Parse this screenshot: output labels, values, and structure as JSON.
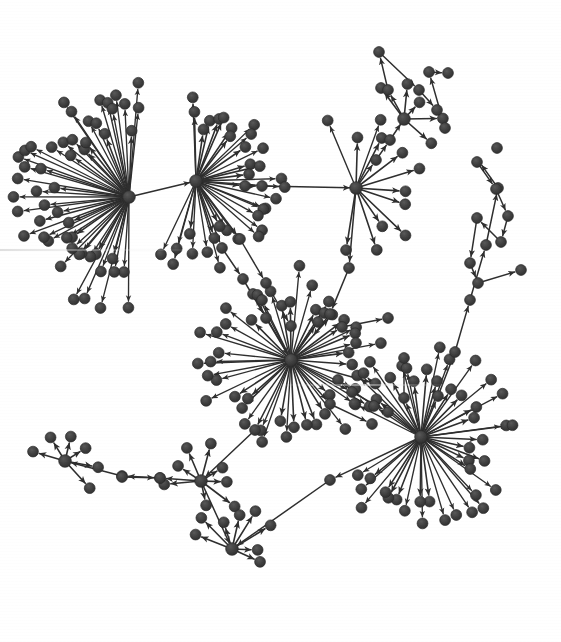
{
  "figure": {
    "kind": "directed-network-graph",
    "background_color": "#ffffff",
    "node_color": "#3c3c3c",
    "node_stroke_color": "#2a2a2a",
    "edge_color": "#2e2e2e",
    "arrow_color": "#2e2e2e",
    "width": 561,
    "height": 642
  },
  "chart_data": {
    "type": "scatter",
    "title": "",
    "subtitle": "",
    "xlabel": "",
    "ylabel": "",
    "grid": false,
    "legend": null,
    "xlim": [
      0,
      561
    ],
    "ylim": [
      0,
      642
    ],
    "node_radius": 5.4,
    "node_count": 292,
    "edge_count": 318,
    "hubs": [
      {
        "id": "H1",
        "label": "hub-upper-left",
        "x": 129,
        "y": 197,
        "degree": 62
      },
      {
        "id": "H2",
        "label": "hub-upper-mid",
        "x": 196,
        "y": 181,
        "degree": 40
      },
      {
        "id": "H3",
        "label": "hub-center",
        "x": 291,
        "y": 360,
        "degree": 58
      },
      {
        "id": "H4",
        "label": "hub-right",
        "x": 421,
        "y": 437,
        "degree": 54
      },
      {
        "id": "H5",
        "label": "hub-top-right",
        "x": 356,
        "y": 188,
        "degree": 14
      },
      {
        "id": "H6",
        "label": "hub-bottom-left",
        "x": 65,
        "y": 461,
        "degree": 7
      },
      {
        "id": "H7",
        "label": "hub-bottom-mid",
        "x": 201,
        "y": 481,
        "degree": 8
      },
      {
        "id": "H8",
        "label": "hub-bottom-center",
        "x": 232,
        "y": 549,
        "degree": 8
      },
      {
        "id": "H9",
        "label": "hub-upper-right-fan",
        "x": 404,
        "y": 119,
        "degree": 6
      }
    ],
    "clusters": [
      {
        "id": "C1",
        "hub": "H1",
        "center": [
          129,
          197
        ],
        "leaf_count": 52,
        "radius_range": [
          38,
          118
        ],
        "angle_range_deg": [
          92,
          278
        ],
        "note": "largest fan, opens to the left/down-left"
      },
      {
        "id": "C2",
        "hub": "H2",
        "center": [
          196,
          181
        ],
        "leaf_count": 34,
        "radius_range": [
          30,
          92
        ],
        "angle_range_deg": [
          -95,
          115
        ],
        "note": "fan opens up/right, overlaps C1"
      },
      {
        "id": "C3",
        "hub": "H3",
        "center": [
          291,
          360
        ],
        "leaf_count": 46,
        "radius_range": [
          30,
          95
        ],
        "angle_range_deg": [
          -180,
          180
        ],
        "note": "full radial burst, center of figure"
      },
      {
        "id": "C4",
        "hub": "H4",
        "center": [
          421,
          437
        ],
        "leaf_count": 44,
        "radius_range": [
          28,
          95
        ],
        "angle_range_deg": [
          -150,
          150
        ],
        "note": "fan opens right/down"
      },
      {
        "id": "C5",
        "hub": "H5",
        "center": [
          356,
          188
        ],
        "leaf_count": 12,
        "radius_range": [
          32,
          75
        ],
        "angle_range_deg": [
          -110,
          95
        ],
        "note": "small fan, bridges to chain going up-right"
      }
    ],
    "bridges": [
      {
        "from": "H2",
        "to": "H5",
        "style": "long-horizontal",
        "waypoints": [
          [
            196,
            181
          ],
          [
            245,
            186
          ],
          [
            262,
            186
          ],
          [
            356,
            188
          ]
        ]
      },
      {
        "from": "H2",
        "to": "H3",
        "style": "chain-down-right",
        "waypoints": [
          [
            196,
            181
          ],
          [
            222,
            248
          ],
          [
            243,
            279
          ],
          [
            266,
            318
          ],
          [
            291,
            360
          ]
        ]
      },
      {
        "from": "H5",
        "to": "H3",
        "style": "chain-down",
        "waypoints": [
          [
            356,
            188
          ],
          [
            349,
            268
          ],
          [
            330,
            314
          ],
          [
            310,
            340
          ]
        ]
      },
      {
        "from": "H3",
        "to": "H4",
        "style": "chain-right",
        "waypoints": [
          [
            291,
            360
          ],
          [
            352,
            392
          ],
          [
            388,
            412
          ],
          [
            421,
            437
          ]
        ]
      },
      {
        "from": "H3",
        "to": "H7",
        "style": "chain-down-left",
        "waypoints": [
          [
            291,
            360
          ],
          [
            255,
            430
          ],
          [
            201,
            481
          ]
        ]
      },
      {
        "from": "H7",
        "to": "H6",
        "style": "chain-left",
        "waypoints": [
          [
            201,
            481
          ],
          [
            160,
            478
          ],
          [
            122,
            476
          ],
          [
            65,
            461
          ]
        ]
      },
      {
        "from": "H7",
        "to": "H8",
        "style": "chain-down",
        "waypoints": [
          [
            201,
            481
          ],
          [
            232,
            549
          ]
        ]
      },
      {
        "from": "H4",
        "to": "H8",
        "style": "long-up-left",
        "waypoints": [
          [
            421,
            437
          ],
          [
            330,
            480
          ],
          [
            232,
            549
          ]
        ]
      },
      {
        "from": "H4",
        "to": "far-right-chain",
        "style": "chain-up-right",
        "waypoints": [
          [
            421,
            437
          ],
          [
            438,
            396
          ],
          [
            455,
            352
          ],
          [
            470,
            300
          ],
          [
            486,
            245
          ],
          [
            498,
            188
          ],
          [
            478,
            160
          ]
        ]
      },
      {
        "from": "H5",
        "to": "H9",
        "style": "chain-up-right",
        "waypoints": [
          [
            356,
            188
          ],
          [
            376,
            160
          ],
          [
            390,
            140
          ],
          [
            404,
            119
          ]
        ]
      }
    ],
    "chains": [
      {
        "id": "ch-top-right",
        "nodes": [
          [
            404,
            119
          ],
          [
            388,
            90
          ],
          [
            379,
            52
          ],
          [
            419,
            90
          ],
          [
            437,
            110
          ],
          [
            445,
            128
          ],
          [
            429,
            72
          ],
          [
            448,
            73
          ]
        ],
        "note": "upper right branching chain"
      },
      {
        "id": "ch-far-right",
        "nodes": [
          [
            477,
            162
          ],
          [
            496,
            189
          ],
          [
            508,
            216
          ],
          [
            501,
            242
          ],
          [
            477,
            218
          ],
          [
            470,
            263
          ],
          [
            478,
            283
          ],
          [
            521,
            270
          ],
          [
            497,
            148
          ]
        ],
        "note": "far right vertical zigzag chain"
      },
      {
        "id": "ch-bottom-left",
        "nodes": [
          [
            122,
            477
          ],
          [
            160,
            478
          ],
          [
            65,
            461
          ]
        ],
        "note": "bottom left connector chain"
      }
    ],
    "annotations": []
  }
}
